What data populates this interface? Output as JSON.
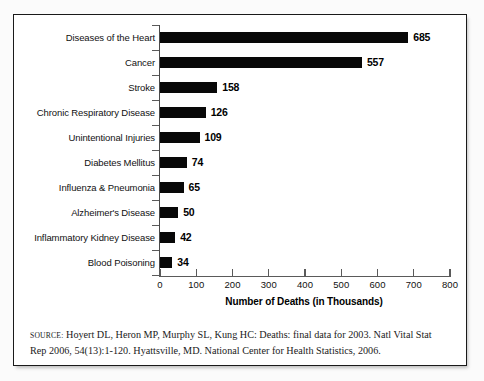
{
  "figure": {
    "source_label": "SOURCE:",
    "source_line1": "Hoyert DL, Heron MP, Murphy SL, Kung HC: Deaths: final data for 2003. Natl Vital Stat",
    "source_line2": "Rep 2006, 54(13):1-120. Hyattsville, MD.  National Center for Health Statistics, 2006.",
    "bar_color": "#080808",
    "frame_color": "#1a1a1a",
    "background": "#ffffff"
  },
  "chart_data": {
    "type": "bar",
    "orientation": "horizontal",
    "title": "",
    "subtitle": "",
    "xlabel": "Number of Deaths (in Thousands)",
    "ylabel": "",
    "xlim": [
      0,
      800
    ],
    "xticks": [
      0,
      100,
      200,
      300,
      400,
      500,
      600,
      700,
      800
    ],
    "xtick_labels": [
      "0",
      "100",
      "200",
      "300",
      "400",
      "500",
      "600",
      "700",
      "800"
    ],
    "grid": false,
    "legend": false,
    "data_labels": true,
    "categories": [
      "Diseases of the Heart",
      "Cancer",
      "Stroke",
      "Chronic Respiratory Disease",
      "Unintentional Injuries",
      "Diabetes Mellitus",
      "Influenza & Pneumonia",
      "Alzheimer's Disease",
      "Inflammatory Kidney Disease",
      "Blood Poisoning"
    ],
    "values": [
      685,
      557,
      158,
      126,
      109,
      74,
      65,
      50,
      42,
      34
    ],
    "value_labels": [
      "685",
      "557",
      "158",
      "126",
      "109",
      "74",
      "65",
      "50",
      "42",
      "34"
    ]
  }
}
